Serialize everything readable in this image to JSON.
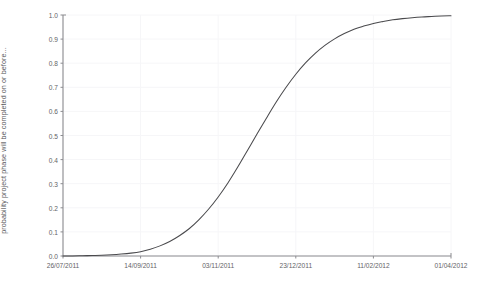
{
  "chart_data": {
    "type": "line",
    "title": "",
    "subtitle": "",
    "xlabel": "",
    "ylabel": "probability project phase will be completed on or before...",
    "ylim": [
      0.0,
      1.0
    ],
    "grid": true,
    "legend": "none",
    "y_ticks": [
      "0.0",
      "0.1",
      "0.2",
      "0.3",
      "0.4",
      "0.5",
      "0.6",
      "0.7",
      "0.8",
      "0.9",
      "1.0"
    ],
    "y_tick_values": [
      0.0,
      0.1,
      0.2,
      0.3,
      0.4,
      0.5,
      0.6,
      0.7,
      0.8,
      0.9,
      1.0
    ],
    "x_ticks": [
      "26/07/2011",
      "14/09/2011",
      "03/11/2011",
      "23/12/2011",
      "11/02/2012",
      "01/04/2012"
    ],
    "x_tick_positions": [
      0.0,
      0.2,
      0.4,
      0.6,
      0.8,
      1.0
    ],
    "series": [
      {
        "name": "cumulative completion probability",
        "color": "#4a4a4d",
        "x": [
          0.0,
          0.025,
          0.05,
          0.075,
          0.1,
          0.125,
          0.15,
          0.175,
          0.2,
          0.225,
          0.25,
          0.275,
          0.3,
          0.325,
          0.35,
          0.375,
          0.4,
          0.425,
          0.45,
          0.475,
          0.5,
          0.525,
          0.55,
          0.575,
          0.6,
          0.625,
          0.65,
          0.675,
          0.7,
          0.725,
          0.75,
          0.775,
          0.8,
          0.825,
          0.85,
          0.875,
          0.9,
          0.925,
          0.95,
          0.975,
          1.0
        ],
        "values": [
          0.0,
          0.0,
          0.001,
          0.002,
          0.003,
          0.005,
          0.008,
          0.012,
          0.018,
          0.028,
          0.042,
          0.06,
          0.084,
          0.113,
          0.15,
          0.194,
          0.245,
          0.303,
          0.368,
          0.437,
          0.506,
          0.574,
          0.64,
          0.7,
          0.754,
          0.801,
          0.841,
          0.874,
          0.901,
          0.923,
          0.941,
          0.954,
          0.965,
          0.973,
          0.98,
          0.985,
          0.989,
          0.992,
          0.994,
          0.996,
          0.997
        ]
      }
    ],
    "axis_color": "#8c8c90",
    "grid_color": "#f6f6f8",
    "background_color": "#ffffff"
  },
  "axis": {
    "y_title": "probability project phase will be completed on or before...",
    "y_labels": [
      "1.0",
      "0.9",
      "0.8",
      "0.7",
      "0.6",
      "0.5",
      "0.4",
      "0.3",
      "0.2",
      "0.1",
      "0.0"
    ],
    "x_labels": [
      "26/07/2011",
      "14/09/2011",
      "03/11/2011",
      "23/12/2011",
      "11/02/2012",
      "01/04/2012"
    ]
  }
}
